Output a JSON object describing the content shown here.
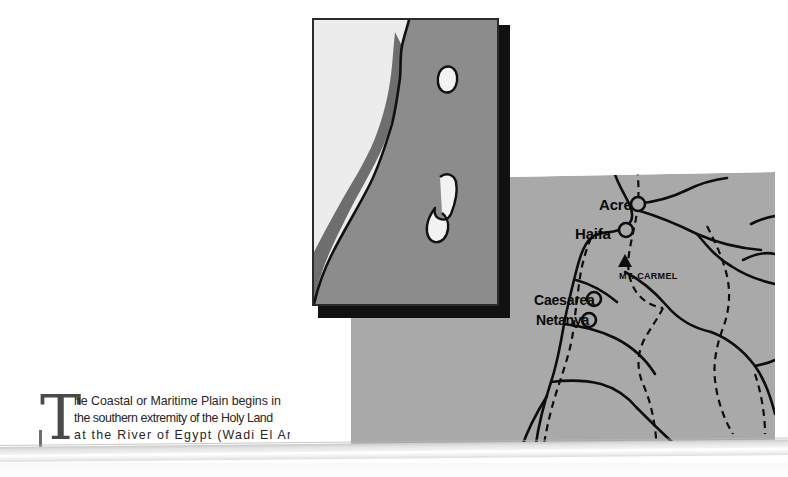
{
  "document": {
    "type": "book-page-scan",
    "background_color": "#ffffff"
  },
  "inset_map": {
    "name": "holy-land-overview-inset",
    "description": "Schematic outline map of the Holy Land showing the coastal plain band, the Sea of Galilee and the Dead Sea",
    "colors": {
      "sea": "#ececec",
      "land": "#8c8c8c",
      "coastal_plain_band": "#6e6e6e",
      "lake_fill": "#f2f2f2",
      "outline": "#111111",
      "frame": "#2b2b2b",
      "shadow": "#111111"
    },
    "features": [
      {
        "name": "mediterranean-sea",
        "shape": "sea-area"
      },
      {
        "name": "coastal-plain-band",
        "shape": "highlighted-strip"
      },
      {
        "name": "sea-of-galilee",
        "shape": "small-lake"
      },
      {
        "name": "dead-sea",
        "shape": "large-lake"
      },
      {
        "name": "coastline",
        "shape": "outline-stroke"
      }
    ]
  },
  "main_map": {
    "name": "northern-coastal-plain-detail-map",
    "colors": {
      "land": "#a9a9a9",
      "line": "#0d0d0d",
      "label": "#0a0a0a"
    },
    "labels": [
      {
        "id": "acre",
        "text": "Acre",
        "kind": "city"
      },
      {
        "id": "haifa",
        "text": "Haifa",
        "kind": "city"
      },
      {
        "id": "caesarea",
        "text": "Caesarea",
        "kind": "city"
      },
      {
        "id": "netanya",
        "text": "Netanya",
        "kind": "city"
      },
      {
        "id": "carmel",
        "text": "MT. CARMEL",
        "kind": "mountain"
      }
    ],
    "symbols": [
      {
        "name": "city-marker-circle",
        "count": 4
      },
      {
        "name": "mountain-triangle",
        "count": 1
      }
    ],
    "line_styles": [
      "solid-road",
      "dashed-boundary"
    ]
  },
  "body_text": {
    "dropcap": "T",
    "lines": [
      "he Coastal or Maritime Plain begins in",
      "the southern extremity of the Holy Land",
      "at the River of Egypt (Wadi El Arish)",
      "and"
    ],
    "full_text": "The Coastal or Maritime Plain begins in the southern extremity of the Holy Land at the River of Egypt (Wadi El Arish) and"
  }
}
